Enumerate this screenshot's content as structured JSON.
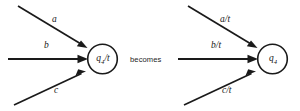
{
  "figure": {
    "caption_connector": "becomes",
    "left_diagram": {
      "node": {
        "id": "q4-slash-t",
        "label_base": "q",
        "label_sub": "4",
        "label_suffix": "/t"
      },
      "edges": [
        {
          "name": "edge-a",
          "label": "a",
          "direction": "down-right"
        },
        {
          "name": "edge-b",
          "label": "b",
          "direction": "right"
        },
        {
          "name": "edge-c",
          "label": "c",
          "direction": "up-right"
        }
      ]
    },
    "right_diagram": {
      "node": {
        "id": "q4",
        "label_base": "q",
        "label_sub": "4",
        "label_suffix": ""
      },
      "edges": [
        {
          "name": "edge-a-t",
          "label": "a/t",
          "direction": "down-right"
        },
        {
          "name": "edge-b-t",
          "label": "b/t",
          "direction": "right"
        },
        {
          "name": "edge-c-t",
          "label": "c/t",
          "direction": "up-right"
        }
      ]
    },
    "colors": {
      "ink": "#1a1a1a",
      "background": "#ffffff"
    }
  }
}
